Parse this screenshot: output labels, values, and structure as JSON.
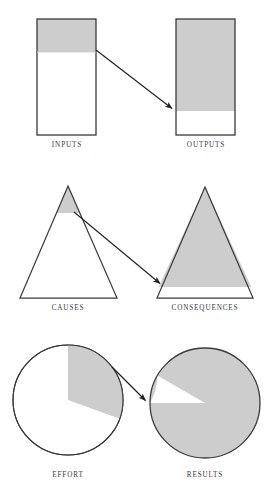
{
  "figure": {
    "kind": "three-pair-proportion-diagram",
    "width": 274,
    "height": 498,
    "background_color": "#ffffff",
    "shade_color": "#cdcdcd",
    "outline_color": "#3a3a3a",
    "arrow_color": "#222222"
  },
  "rows": [
    {
      "id": "row-rectangles",
      "shape": "rectangle",
      "left": {
        "label": "INPUTS",
        "shaded_fraction": 0.25,
        "shade_position": "top",
        "x": 37,
        "y": 19,
        "width": 59,
        "height": 116,
        "shade_height": 33,
        "label_x": 67,
        "label_y": 142
      },
      "right": {
        "label": "OUTPUTS",
        "shaded_fraction": 0.79,
        "shade_position": "top",
        "x": 176,
        "y": 19,
        "width": 59,
        "height": 116,
        "shade_height": 92,
        "label_x": 206,
        "label_y": 142
      },
      "arrow": {
        "from_x": 96,
        "from_y": 50,
        "to_x": 174,
        "to_y": 110
      }
    },
    {
      "id": "row-triangles",
      "shape": "triangle",
      "left": {
        "label": "CAUSES",
        "shaded_fraction": 0.07,
        "shade_position": "top",
        "apex_x": 68,
        "apex_y": 186,
        "base_left_x": 20,
        "base_right_x": 117,
        "base_y": 298,
        "shade_cut_y": 213,
        "label_x": 68,
        "label_y": 305
      },
      "right": {
        "label": "CONSEQUENCES",
        "shaded_fraction": 0.82,
        "shade_position": "top",
        "apex_x": 205,
        "apex_y": 187,
        "base_left_x": 157,
        "base_right_x": 253,
        "base_y": 298,
        "shade_cut_y": 287,
        "label_x": 205,
        "label_y": 305
      },
      "arrow": {
        "from_x": 74,
        "from_y": 212,
        "to_x": 162,
        "to_y": 285
      }
    },
    {
      "id": "row-circles",
      "shape": "circle",
      "left": {
        "label": "EFFORT",
        "shaded_fraction": 0.2,
        "shade_position": "slice",
        "center_x": 68,
        "center_y": 400,
        "radius": 55,
        "slice_start_deg": 0,
        "slice_end_deg": 110,
        "label_x": 68,
        "label_y": 472
      },
      "right": {
        "label": "RESULTS",
        "shaded_fraction": 0.86,
        "shade_position": "slice-inverted",
        "center_x": 205,
        "center_y": 403,
        "radius": 55,
        "white_start_deg": 300,
        "white_end_deg": 270,
        "label_x": 205,
        "label_y": 472
      },
      "arrow": {
        "from_x": 112,
        "from_y": 367,
        "to_x": 147,
        "to_y": 402
      }
    }
  ]
}
